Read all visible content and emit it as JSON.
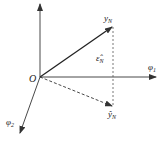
{
  "diagram": {
    "origin_label": "O",
    "axes": [
      {
        "id": "vertical",
        "label": ""
      },
      {
        "id": "phi1",
        "label": "φ",
        "subscript": "1"
      },
      {
        "id": "phi2",
        "label": "φ",
        "subscript": "2"
      }
    ],
    "vectors": [
      {
        "id": "y_N",
        "label": "y",
        "subscript": "N",
        "style": "solid"
      },
      {
        "id": "y_hat_N",
        "label": "ŷ",
        "subscript": "N",
        "style": "dashed"
      }
    ],
    "residual": {
      "id": "eps_hat_N",
      "label": "ε̂",
      "subscript": "N",
      "style": "dashed"
    },
    "colors": {
      "stroke": "#333333",
      "background": "#ffffff"
    }
  }
}
